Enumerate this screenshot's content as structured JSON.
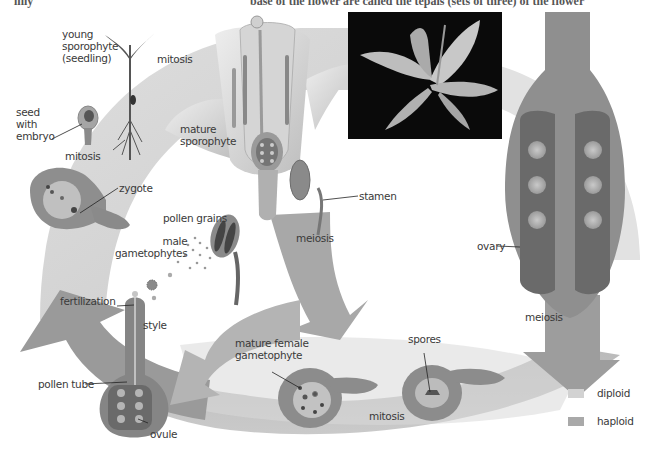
{
  "header": {
    "left_fragment": "lilly",
    "right_fragment": "base of the flower are called the tepals (sets of three) of the flower"
  },
  "colors": {
    "diploid": "#d2d2d2",
    "haploid": "#a9a9a9",
    "ovary_fill": "#8f8f8f",
    "ovary_dark": "#6a6a6a",
    "photo_bg": "#0a0a0a"
  },
  "labels": {
    "young_sporophyte": "young\nsporophyte\n(seedling)",
    "mitosis_top": "mitosis",
    "seed_with_embryo": "seed\nwith\nembryo",
    "mitosis_left": "mitosis",
    "zygote": "zygote",
    "mature_sporophyte": "mature\nsporophyte",
    "stamen": "stamen",
    "meiosis_center": "meiosis",
    "pollen_grains": "pollen grains",
    "male_gametophytes": "male\ngametophytes",
    "ovary": "ovary",
    "meiosis_right": "meiosis",
    "fertilization": "fertilization",
    "style": "style",
    "pollen_tube": "pollen tube",
    "ovule": "ovule",
    "mature_female_gametophyte": "mature female\ngametophyte",
    "spores": "spores",
    "mitosis_bottom": "mitosis"
  },
  "legend": [
    {
      "label": "diploid",
      "color": "#d2d2d2"
    },
    {
      "label": "haploid",
      "color": "#a9a9a9"
    }
  ]
}
